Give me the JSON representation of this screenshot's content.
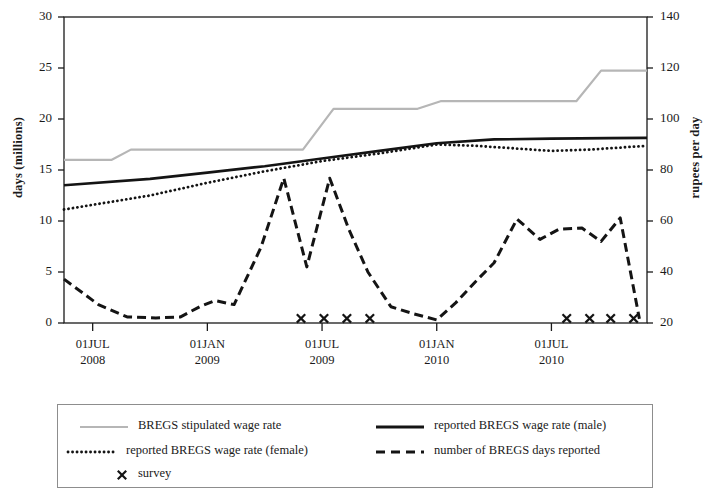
{
  "chart_data": {
    "type": "line",
    "title": "",
    "xlabel": "",
    "ylabel": "days (millions)",
    "y2label": "rupees per day",
    "ylim": [
      0,
      30
    ],
    "y2lim": [
      20,
      140
    ],
    "grid": false,
    "legend_position": "bottom",
    "x_tick_labels": [
      {
        "line1": "01JUL",
        "line2": "2008"
      },
      {
        "line1": "01JAN",
        "line2": "2009"
      },
      {
        "line1": "01JUL",
        "line2": "2009"
      },
      {
        "line1": "01JAN",
        "line2": "2010"
      },
      {
        "line1": "01JUL",
        "line2": "2010"
      }
    ],
    "y_tick_labels": [
      "0",
      "5",
      "10",
      "15",
      "20",
      "25",
      "30"
    ],
    "y2_tick_labels": [
      "20",
      "40",
      "60",
      "80",
      "100",
      "120",
      "140"
    ],
    "x_tick_values": [
      0,
      6,
      12,
      18,
      24
    ],
    "x_range": [
      -1.5,
      29
    ],
    "series": [
      {
        "name": "BREGS stipulated wage rate",
        "style": "solid-gray",
        "color": "#b6b6b6",
        "axis": "right",
        "x": [
          -1.5,
          1.0,
          2.0,
          11.0,
          12.6,
          17.0,
          18.2,
          25.3,
          26.6,
          29
        ],
        "values": [
          84,
          84,
          88,
          88,
          104,
          104,
          107,
          107,
          119,
          119
        ]
      },
      {
        "name": "reported BREGS wage rate (male)",
        "style": "solid-black",
        "color": "#141414",
        "axis": "right",
        "x": [
          -1.5,
          3,
          6,
          9,
          12,
          15,
          18,
          21,
          24,
          27,
          29
        ],
        "values": [
          74,
          76.5,
          79,
          81.5,
          84.5,
          87.5,
          90.5,
          92,
          92.3,
          92.5,
          92.6
        ]
      },
      {
        "name": "reported BREGS wage rate (female)",
        "style": "dotted",
        "color": "#141414",
        "axis": "right",
        "x": [
          -1.5,
          3,
          6,
          9,
          12,
          15,
          18,
          20,
          22,
          24,
          26,
          29
        ],
        "values": [
          64.5,
          70,
          75,
          79.5,
          83.5,
          86.5,
          90,
          89.5,
          88.5,
          87.5,
          88,
          89.5
        ]
      },
      {
        "name": "number of BREGS days reported",
        "style": "dashed",
        "color": "#141414",
        "axis": "left",
        "x": [
          -1.5,
          0.3,
          1.8,
          3.3,
          4.6,
          5.6,
          6.4,
          7.4,
          8.8,
          10.0,
          11.2,
          12.4,
          13.4,
          14.4,
          15.6,
          16.8,
          18.0,
          19.0,
          20.0,
          21.0,
          22.2,
          23.4,
          24.4,
          25.6,
          26.6,
          27.6,
          28.6
        ],
        "values": [
          4.3,
          1.8,
          0.6,
          0.5,
          0.6,
          1.6,
          2.2,
          1.8,
          7.4,
          14.2,
          5.5,
          14.2,
          9.2,
          5.0,
          1.6,
          0.9,
          0.3,
          2.0,
          4.0,
          5.9,
          10.2,
          8.2,
          9.2,
          9.3,
          8.0,
          10.3,
          0.4
        ]
      }
    ],
    "survey_markers": {
      "name": "survey",
      "marker": "x",
      "y_value": 0.45,
      "x": [
        10.9,
        12.1,
        13.3,
        14.5,
        24.8,
        26.0,
        27.1,
        28.3
      ]
    }
  },
  "legend": {
    "entries": [
      {
        "label": "BREGS stipulated wage rate",
        "key": "solid-gray"
      },
      {
        "label": "reported BREGS wage rate (male)",
        "key": "solid-black"
      },
      {
        "label": "reported BREGS wage rate (female)",
        "key": "dotted"
      },
      {
        "label": "number of BREGS days reported",
        "key": "dashed"
      },
      {
        "label": "survey",
        "key": "x-marker"
      }
    ]
  },
  "colors": {
    "axis": "#1a1a1a",
    "gray_series": "#b6b6b6",
    "black_series": "#141414",
    "legend_border": "#8d8d8d",
    "background": "#ffffff"
  }
}
